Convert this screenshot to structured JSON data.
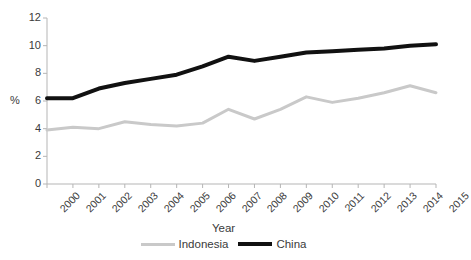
{
  "chart_data": {
    "type": "line",
    "title": "",
    "xlabel": "Year",
    "ylabel": "%",
    "grid": false,
    "legend_position": "bottom",
    "xlim": [
      2000,
      2015
    ],
    "ylim": [
      0,
      12
    ],
    "ytick_labels": [
      "12",
      "10",
      "8",
      "6",
      "4",
      "2",
      "0"
    ],
    "ytick_values": [
      12,
      10,
      8,
      6,
      4,
      2,
      0
    ],
    "categories": [
      "2000",
      "2001",
      "2002",
      "2003",
      "2004",
      "2005",
      "2006",
      "2007",
      "2008",
      "2009",
      "2010",
      "2011",
      "2012",
      "2013",
      "2014",
      "2015"
    ],
    "series": [
      {
        "name": "Indonesia",
        "color": "#c9c9c9",
        "values": [
          3.9,
          4.1,
          4.0,
          4.5,
          4.3,
          4.2,
          4.4,
          5.4,
          4.7,
          5.4,
          6.3,
          5.9,
          6.2,
          6.6,
          7.1,
          6.6
        ]
      },
      {
        "name": "China",
        "color": "#111111",
        "values": [
          6.2,
          6.2,
          6.9,
          7.3,
          7.6,
          7.9,
          8.5,
          9.2,
          8.9,
          9.2,
          9.5,
          9.6,
          9.7,
          9.8,
          10.0,
          10.1
        ]
      }
    ]
  },
  "axes": {
    "y_title": "%",
    "x_title": "Year"
  },
  "legend": {
    "items": [
      {
        "label": "Indonesia",
        "color": "#c9c9c9"
      },
      {
        "label": "China",
        "color": "#111111"
      }
    ]
  }
}
